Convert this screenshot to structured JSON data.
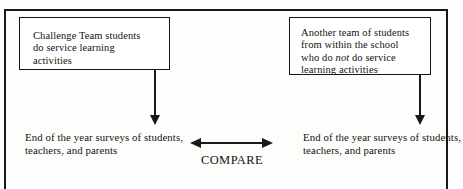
{
  "figure": {
    "groups": [
      {
        "id": "treatment-group",
        "line1": "Challenge Team students",
        "line2": "do service learning",
        "line3": "activities"
      },
      {
        "id": "comparison-group",
        "line1": "Another team of students",
        "line2": "from within the school",
        "line3_pre": "who do ",
        "line3_em": "not",
        "line3_post": " do service",
        "line4": "learning activities"
      }
    ],
    "outcomes": {
      "left": "End of the year surveys of students, teachers, and parents",
      "right": "End of the year surveys of students, teachers, and parents"
    },
    "compare": {
      "label": "COMPARE"
    },
    "colors": {
      "ink": "#1b1714",
      "page": "#fdfdfc"
    }
  }
}
